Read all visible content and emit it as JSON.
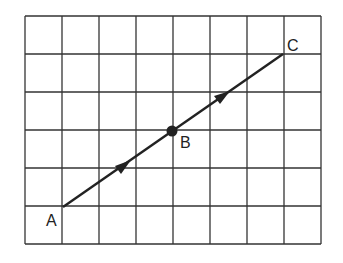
{
  "diagram": {
    "grid": {
      "cols": 8,
      "rows": 6,
      "x0": 25,
      "y0": 16,
      "cell_w": 37,
      "cell_h": 38,
      "line_color": "#333333"
    },
    "points": [
      {
        "label": "A",
        "col": 1,
        "row": 5
      },
      {
        "label": "B",
        "col": 4,
        "row": 3,
        "marked": true
      },
      {
        "label": "C",
        "col": 7,
        "row": 1
      }
    ],
    "segments": [
      {
        "from": "A",
        "to": "B",
        "arrow": "single"
      },
      {
        "from": "B",
        "to": "C",
        "arrow": "single"
      }
    ],
    "labels": {
      "a": "A",
      "b": "B",
      "c": "C"
    }
  }
}
